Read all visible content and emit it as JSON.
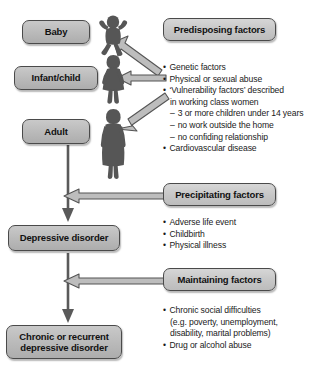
{
  "diagram": {
    "colors": {
      "box_fill": "#c0c0c0",
      "box_border": "#4a4a4a",
      "silhouette": "#565656",
      "arrow_fill": "#b5b5b5",
      "arrow_border": "#4a4a4a",
      "line": "#5a5a5a",
      "text": "#1a1a1a"
    },
    "stages": [
      {
        "id": "baby",
        "label": "Baby"
      },
      {
        "id": "infant-child",
        "label": "Infant/child"
      },
      {
        "id": "adult",
        "label": "Adult"
      },
      {
        "id": "depressive-disorder",
        "label": "Depressive disorder"
      },
      {
        "id": "chronic-recurrent",
        "label": "Chronic or recurrent\ndepressive disorder",
        "line1": "Chronic or recurrent",
        "line2": "depressive disorder"
      }
    ],
    "figures": [
      {
        "id": "baby-silhouette",
        "name": "baby-figure"
      },
      {
        "id": "child-silhouette",
        "name": "child-figure"
      },
      {
        "id": "adult-silhouette",
        "name": "adult-woman-figure"
      }
    ],
    "factor_groups": [
      {
        "id": "predisposing",
        "heading": "Predisposing factors",
        "bullets": [
          {
            "level": 0,
            "text": "Genetic factors"
          },
          {
            "level": 0,
            "text": "Physical or sexual abuse"
          },
          {
            "level": 0,
            "text": "‘Vulnerability factors’ described"
          },
          {
            "level": "cont",
            "text": "in working class women"
          },
          {
            "level": "dash",
            "text": "3 or more children under 14 years"
          },
          {
            "level": "dash",
            "text": "no work outside the home"
          },
          {
            "level": "dash",
            "text": "no confiding relationship"
          },
          {
            "level": 0,
            "text": "Cardiovascular disease"
          }
        ]
      },
      {
        "id": "precipitating",
        "heading": "Precipitating factors",
        "bullets": [
          {
            "level": 0,
            "text": "Adverse life event"
          },
          {
            "level": 0,
            "text": "Childbirth"
          },
          {
            "level": 0,
            "text": "Physical illness"
          }
        ]
      },
      {
        "id": "maintaining",
        "heading": "Maintaining factors",
        "bullets": [
          {
            "level": 0,
            "text": "Chronic social difficulties"
          },
          {
            "level": "cont",
            "text": "(e.g. poverty, unemployment,"
          },
          {
            "level": "cont",
            "text": "disability, marital problems)"
          },
          {
            "level": 0,
            "text": "Drug or alcohol abuse"
          }
        ]
      }
    ],
    "arrows": [
      {
        "id": "predisposing-to-baby",
        "name": "arrow-predisposing-to-baby",
        "direction": "up-left"
      },
      {
        "id": "predisposing-to-child",
        "name": "arrow-predisposing-to-child",
        "direction": "left"
      },
      {
        "id": "predisposing-to-adult",
        "name": "arrow-predisposing-to-adult",
        "direction": "down-left"
      },
      {
        "id": "precipitating-to-flow",
        "name": "arrow-precipitating-to-flow",
        "direction": "left"
      },
      {
        "id": "maintaining-to-flow",
        "name": "arrow-maintaining-to-flow",
        "direction": "left"
      },
      {
        "id": "adult-to-depressive",
        "name": "arrow-adult-to-depressive",
        "direction": "down"
      },
      {
        "id": "depressive-to-chronic",
        "name": "arrow-depressive-to-chronic",
        "direction": "down"
      }
    ]
  }
}
